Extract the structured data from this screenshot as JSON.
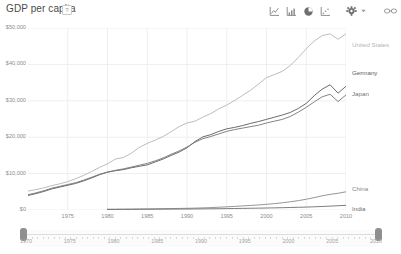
{
  "header": {
    "title": "GDP per capita",
    "help_icon": "?",
    "toolbar": [
      {
        "name": "line-chart-icon",
        "label": "Line chart"
      },
      {
        "name": "bar-chart-icon",
        "label": "Bar chart"
      },
      {
        "name": "pie-chart-icon",
        "label": "Pie chart"
      },
      {
        "name": "scatter-chart-icon",
        "label": "Scatter chart"
      },
      {
        "name": "gear-icon",
        "label": "Settings"
      },
      {
        "name": "chevron-down-icon",
        "label": "More"
      },
      {
        "name": "link-icon",
        "label": "Share link"
      }
    ]
  },
  "slider": {
    "start_label": "1970",
    "end_label": "2010",
    "ticks": [
      "1970",
      "1975",
      "1980",
      "1985",
      "1990",
      "1995",
      "2000",
      "2005",
      "2010"
    ],
    "left_handle": "range-start-handle",
    "right_handle": "range-end-handle"
  },
  "colors": {
    "united_states": "#b4b4b4",
    "germany": "#5a5a5a",
    "japan": "#757575",
    "china": "#8a8a8a",
    "india": "#6e6e6e",
    "grid": "#eeeeee",
    "axis_text": "#8d8d8d",
    "title_text": "#4a4a4a"
  },
  "chart_data": {
    "type": "line",
    "title": "GDP per capita",
    "xlabel": "",
    "ylabel": "",
    "xlim": [
      1970,
      2010
    ],
    "ylim": [
      0,
      50000
    ],
    "grid": true,
    "legend_position": "right-inline",
    "xticks": [
      1975,
      1980,
      1985,
      1990,
      1995,
      2000,
      2005,
      2010
    ],
    "yticks": [
      0,
      10000,
      20000,
      30000,
      40000,
      50000
    ],
    "ytick_labels": [
      "$0",
      "$10,000",
      "$20,000",
      "$30,000",
      "$40,000",
      "$50,000"
    ],
    "x": [
      1970,
      1971,
      1972,
      1973,
      1974,
      1975,
      1976,
      1977,
      1978,
      1979,
      1980,
      1981,
      1982,
      1983,
      1984,
      1985,
      1986,
      1987,
      1988,
      1989,
      1990,
      1991,
      1992,
      1993,
      1994,
      1995,
      1996,
      1997,
      1998,
      1999,
      2000,
      2001,
      2002,
      2003,
      2004,
      2005,
      2006,
      2007,
      2008,
      2009,
      2010
    ],
    "series": [
      {
        "name": "United States",
        "color": "#b4b4b4",
        "values": [
          5200,
          5600,
          6100,
          6700,
          7200,
          7800,
          8600,
          9500,
          10600,
          11700,
          12700,
          14000,
          14400,
          15600,
          17200,
          18300,
          19200,
          20200,
          21500,
          22900,
          23900,
          24400,
          25500,
          26500,
          27800,
          28800,
          30100,
          31500,
          32900,
          34600,
          36400,
          37200,
          38100,
          39700,
          41900,
          44300,
          46400,
          47900,
          48400,
          46900,
          48400
        ]
      },
      {
        "name": "Germany",
        "color": "#5a5a5a",
        "values": [
          4000,
          4500,
          5100,
          5800,
          6300,
          6800,
          7300,
          8000,
          8800,
          9700,
          10400,
          10800,
          11100,
          11600,
          12000,
          12400,
          13200,
          14000,
          15000,
          15900,
          17100,
          18800,
          20100,
          20700,
          21600,
          22300,
          22700,
          23200,
          23800,
          24300,
          24900,
          25500,
          26100,
          26800,
          27900,
          29300,
          31400,
          33200,
          34400,
          32100,
          34000
        ]
      },
      {
        "name": "Japan",
        "color": "#757575",
        "values": [
          4200,
          4700,
          5300,
          6000,
          6500,
          7000,
          7500,
          8200,
          9000,
          9800,
          10400,
          10900,
          11300,
          11800,
          12300,
          12800,
          13500,
          14300,
          15300,
          16200,
          17300,
          18600,
          19600,
          20200,
          20900,
          21600,
          22100,
          22500,
          22900,
          23300,
          23900,
          24400,
          24900,
          25700,
          26900,
          28200,
          29700,
          31100,
          31800,
          29800,
          31600
        ]
      },
      {
        "name": "China",
        "color": "#8a8a8a",
        "start_year": 1980,
        "values": [
          null,
          null,
          null,
          null,
          null,
          null,
          null,
          null,
          null,
          null,
          200,
          215,
          235,
          255,
          285,
          310,
          335,
          365,
          395,
          430,
          470,
          520,
          580,
          660,
          760,
          870,
          990,
          1120,
          1250,
          1390,
          1560,
          1750,
          1980,
          2250,
          2580,
          2960,
          3400,
          3900,
          4300,
          4600,
          5000
        ]
      },
      {
        "name": "India",
        "color": "#6e6e6e",
        "start_year": 1980,
        "values": [
          null,
          null,
          null,
          null,
          null,
          null,
          null,
          null,
          null,
          null,
          150,
          158,
          168,
          178,
          190,
          202,
          215,
          228,
          243,
          258,
          275,
          290,
          310,
          330,
          355,
          382,
          412,
          442,
          475,
          510,
          548,
          590,
          635,
          685,
          742,
          805,
          880,
          965,
          1060,
          1170,
          1290
        ]
      }
    ],
    "series_labels": [
      {
        "name": "United States",
        "y_px": 41
      },
      {
        "name": "Germany",
        "y_px": 69
      },
      {
        "name": "Japan",
        "y_px": 90
      },
      {
        "name": "China",
        "y_px": 185
      },
      {
        "name": "India",
        "y_px": 205
      }
    ]
  }
}
